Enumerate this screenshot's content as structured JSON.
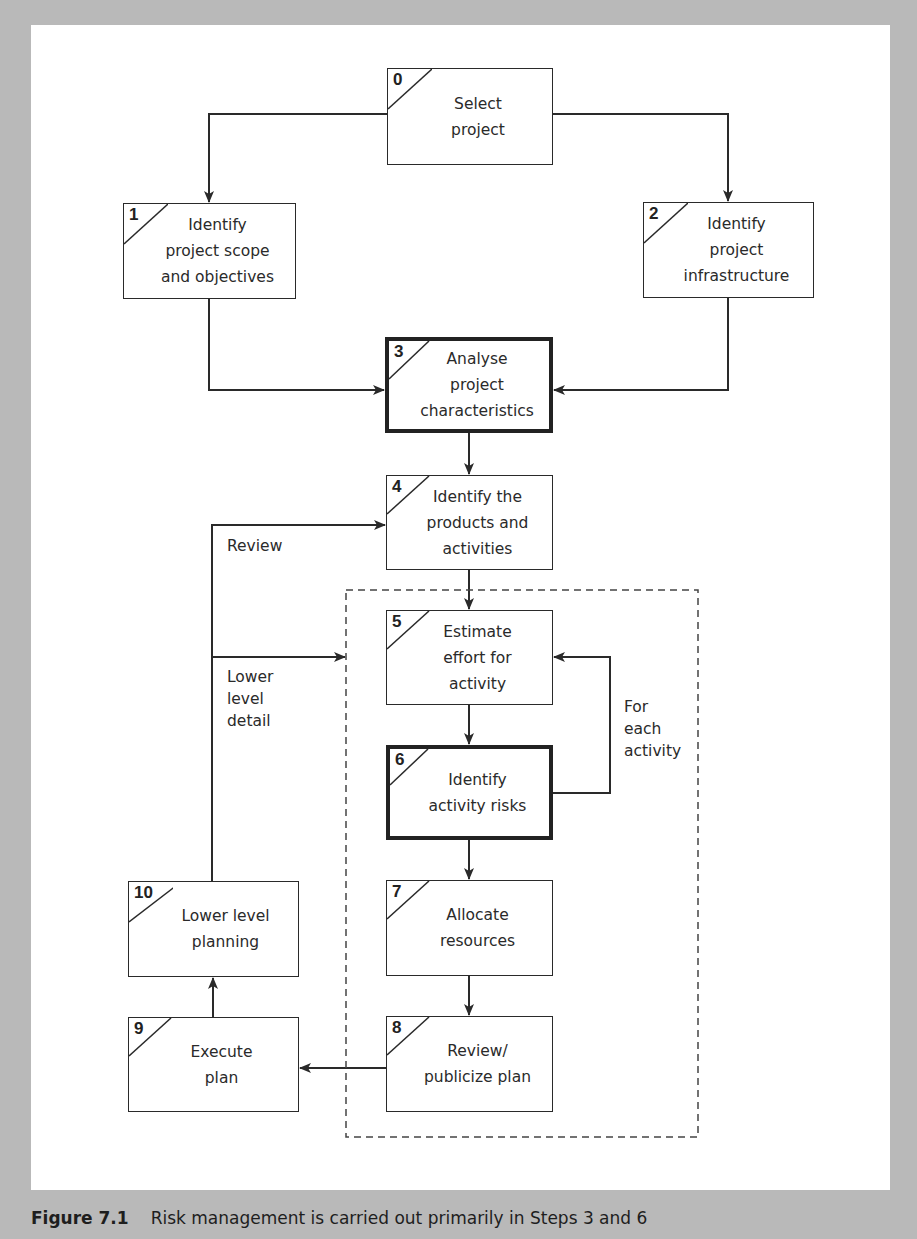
{
  "diagram": {
    "type": "flowchart",
    "steps": [
      {
        "id": "0",
        "label": "Select\nproject",
        "emphasis": false
      },
      {
        "id": "1",
        "label": "Identify\nproject scope\nand objectives",
        "emphasis": false
      },
      {
        "id": "2",
        "label": "Identify\nproject\ninfrastructure",
        "emphasis": false
      },
      {
        "id": "3",
        "label": "Analyse\nproject\ncharacteristics",
        "emphasis": true
      },
      {
        "id": "4",
        "label": "Identify the\nproducts and\nactivities",
        "emphasis": false
      },
      {
        "id": "5",
        "label": "Estimate\neffort for\nactivity",
        "emphasis": false
      },
      {
        "id": "6",
        "label": "Identify\nactivity risks",
        "emphasis": true
      },
      {
        "id": "7",
        "label": "Allocate\nresources",
        "emphasis": false
      },
      {
        "id": "8",
        "label": "Review/\npublicize plan",
        "emphasis": false
      },
      {
        "id": "9",
        "label": "Execute\nplan",
        "emphasis": false
      },
      {
        "id": "10",
        "label": "Lower level\nplanning",
        "emphasis": false
      }
    ],
    "edges": [
      {
        "from": "0",
        "to": "1"
      },
      {
        "from": "0",
        "to": "2"
      },
      {
        "from": "1",
        "to": "3"
      },
      {
        "from": "2",
        "to": "3"
      },
      {
        "from": "3",
        "to": "4"
      },
      {
        "from": "4",
        "to": "5"
      },
      {
        "from": "5",
        "to": "6"
      },
      {
        "from": "6",
        "to": "5",
        "label": "For each activity"
      },
      {
        "from": "6",
        "to": "7"
      },
      {
        "from": "7",
        "to": "8"
      },
      {
        "from": "8",
        "to": "9"
      },
      {
        "from": "9",
        "to": "10"
      },
      {
        "from": "10",
        "to": "4",
        "label": "Review"
      },
      {
        "from": "10",
        "to": "group-5-8",
        "label": "Lower level detail"
      }
    ],
    "annotations": {
      "review": "Review",
      "lower_level_detail": "Lower\nlevel\ndetail",
      "for_each_activity": "For\neach\nactivity"
    }
  },
  "caption": {
    "figure": "Figure 7.1",
    "text": "Risk management is carried out primarily in Steps 3 and 6"
  }
}
